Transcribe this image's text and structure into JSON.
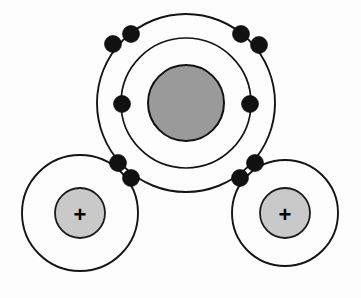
{
  "diagram": {
    "background_color": "#fdfdfd",
    "width": 361,
    "height": 298,
    "stroke_color": "#141414",
    "electron_color": "#111111"
  },
  "atoms": {
    "oxygen": {
      "label": "oxygen",
      "center_x": 186,
      "center_y": 103,
      "nucleus_radius": 38,
      "nucleus_fill": "#9a9a9a",
      "nucleus_stroke": "#111111",
      "shells": [
        {
          "name": "inner-shell",
          "radius": 65
        },
        {
          "name": "outer-shell",
          "radius": 89
        }
      ]
    },
    "hydrogen_left": {
      "label": "hydrogen-left",
      "center_x": 80,
      "center_y": 213,
      "nucleus_radius": 25,
      "nucleus_fill": "#c9c9c9",
      "nucleus_stroke": "#1a1a1a",
      "shell_radius": 58,
      "charge_symbol": "+"
    },
    "hydrogen_right": {
      "label": "hydrogen-right",
      "center_x": 285,
      "center_y": 213,
      "nucleus_radius": 25,
      "nucleus_fill": "#c9c9c9",
      "nucleus_stroke": "#1a1a1a",
      "shell_radius": 53,
      "charge_symbol": "+"
    }
  },
  "electrons": [
    {
      "name": "electron-lone-pair-top-left-outer",
      "x": 113,
      "y": 44,
      "r": 8.5,
      "group": "lone-pair-top-left"
    },
    {
      "name": "electron-lone-pair-top-left-inner",
      "x": 131,
      "y": 34,
      "r": 8.5,
      "group": "lone-pair-top-left"
    },
    {
      "name": "electron-lone-pair-top-right-inner",
      "x": 241,
      "y": 34,
      "r": 8.5,
      "group": "lone-pair-top-right"
    },
    {
      "name": "electron-lone-pair-top-right-outer",
      "x": 259,
      "y": 45,
      "r": 8.5,
      "group": "lone-pair-top-right"
    },
    {
      "name": "electron-left-middle",
      "x": 122,
      "y": 104,
      "r": 8.5,
      "group": "single-left"
    },
    {
      "name": "electron-right-middle",
      "x": 250,
      "y": 104,
      "r": 8.5,
      "group": "single-right"
    },
    {
      "name": "electron-bond-left-upper",
      "x": 118,
      "y": 163,
      "r": 8.5,
      "group": "bond-left"
    },
    {
      "name": "electron-bond-left-lower",
      "x": 131,
      "y": 178,
      "r": 8.5,
      "group": "bond-left"
    },
    {
      "name": "electron-bond-right-upper",
      "x": 255,
      "y": 163,
      "r": 8.5,
      "group": "bond-right"
    },
    {
      "name": "electron-bond-right-lower",
      "x": 240,
      "y": 178,
      "r": 8.5,
      "group": "bond-right"
    }
  ],
  "chart_data": {
    "type": "diagram",
    "atom_count": 3,
    "electron_count": 10,
    "annotations": [
      "+",
      "+"
    ]
  }
}
